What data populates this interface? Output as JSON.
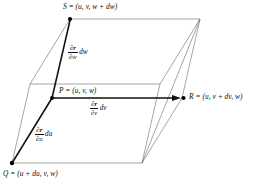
{
  "figure": {
    "type": "geometry-diagram",
    "width": 259,
    "height": 184,
    "colors": {
      "stroke_bold": "#111111",
      "stroke_thin": "#555555",
      "background": "#ffffff",
      "text": "#0d0d0d"
    },
    "vertices": {
      "P": {
        "x": 52,
        "y": 98,
        "label_point": "P",
        "label_full": "P = (u, v, w)"
      },
      "S": {
        "x": 70,
        "y": 19,
        "label_point": "S",
        "label_full": "S = (u, v, w + dw)"
      },
      "R": {
        "x": 182,
        "y": 98,
        "label_point": "R",
        "label_full": "R = (u, v + dv, w)"
      },
      "Q": {
        "x": 12,
        "y": 163,
        "label_point": "Q",
        "label_full": "Q = (u + du, v, w)"
      }
    },
    "labels": {
      "S": {
        "point": "S",
        "equals": "=",
        "coords": "(u, v, w + dw)",
        "text": "S = (u, v, w + dw)",
        "x": 63,
        "y": 4
      },
      "P": {
        "point": "P",
        "equals": "=",
        "coords": "(u, v, w)",
        "text": "P = (u, v, w)",
        "x": 59,
        "y": 88
      },
      "R": {
        "point": "R",
        "equals": "=",
        "coords": "(u, v + dv, w)",
        "text": "R = (u, v + dv, w)",
        "x": 189,
        "y": 94
      },
      "Q": {
        "point": "Q",
        "equals": "=",
        "coords": "(u + du, v, w)",
        "text": "Q = (u + du, v, w)",
        "x": 5,
        "y": 170
      }
    },
    "vectors": [
      {
        "name": "dw-vector",
        "from": "P",
        "to": "S",
        "numerator": "∂r",
        "denominator": "∂w",
        "differential": "dw",
        "text": "(∂r/∂w) dw",
        "x": 68,
        "y": 45
      },
      {
        "name": "dv-vector",
        "from": "P",
        "to": "R",
        "numerator": "∂r",
        "denominator": "∂v",
        "differential": "dv",
        "text": "(∂r/∂v) dv",
        "x": 90,
        "y": 101
      },
      {
        "name": "du-vector",
        "from": "P",
        "to": "Q",
        "numerator": "∂r",
        "denominator": "∂u",
        "differential": "du",
        "text": "(∂r/∂u) du",
        "x": 35,
        "y": 127
      }
    ]
  }
}
